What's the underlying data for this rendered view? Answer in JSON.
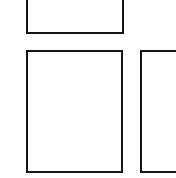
{
  "canvas": {
    "width": 176,
    "height": 178,
    "background_color": "#ffffff",
    "description": "Three empty white rectangles outlined in black on a plain white background"
  },
  "style": {
    "stroke_color": "#161616",
    "stroke_width_px": 2,
    "fill_color": "#ffffff"
  },
  "shapes": [
    {
      "name": "top-rectangle",
      "label": "",
      "x": 26,
      "y": -14,
      "width": 98,
      "height": 48,
      "clipped_edges": "top",
      "fill": "#ffffff",
      "stroke": "#161616"
    },
    {
      "name": "bottom-left-rectangle",
      "label": "",
      "x": 26,
      "y": 50,
      "width": 97,
      "height": 123,
      "clipped_edges": "none",
      "fill": "#ffffff",
      "stroke": "#161616"
    },
    {
      "name": "bottom-right-rectangle",
      "label": "",
      "x": 140,
      "y": 50,
      "width": 52,
      "height": 123,
      "clipped_edges": "right",
      "fill": "#ffffff",
      "stroke": "#161616"
    }
  ]
}
